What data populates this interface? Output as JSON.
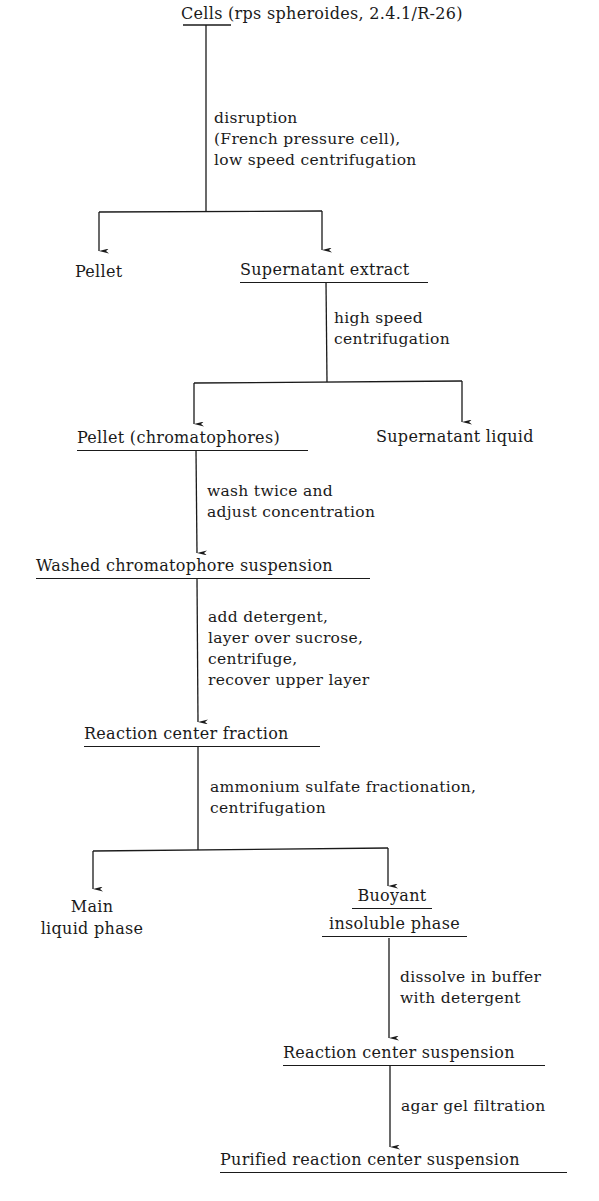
{
  "diagram": {
    "type": "flowchart",
    "nodes": {
      "cells": "Cells (rps spheroides, 2.4.1/R-26)",
      "pellet1": "Pellet",
      "supernatant_extract": "Supernatant extract",
      "pellet_chromatophores": "Pellet (chromatophores)",
      "supernatant_liquid": "Supernatant liquid",
      "washed_suspension": "Washed chromatophore suspension",
      "rc_fraction": "Reaction center fraction",
      "main_liquid_1": "Main",
      "main_liquid_2": "liquid phase",
      "buoyant_1": "Buoyant",
      "buoyant_2": "insoluble phase",
      "rc_suspension": "Reaction center suspension",
      "purified": "Purified reaction center suspension"
    },
    "steps": {
      "s1": [
        "disruption",
        "(French pressure cell),",
        "low speed centrifugation"
      ],
      "s2": [
        "high speed",
        "centrifugation"
      ],
      "s3": [
        "wash twice and",
        "adjust concentration"
      ],
      "s4": [
        "add detergent,",
        "layer over sucrose,",
        "centrifuge,",
        "recover upper layer"
      ],
      "s5": [
        "ammonium sulfate fractionation,",
        "centrifugation"
      ],
      "s6": [
        "dissolve in buffer",
        "with detergent"
      ],
      "s7": [
        "agar gel filtration"
      ]
    },
    "edges": [
      {
        "from": "cells",
        "to": "pellet1",
        "step": "s1"
      },
      {
        "from": "cells",
        "to": "supernatant_extract",
        "step": "s1"
      },
      {
        "from": "supernatant_extract",
        "to": "pellet_chromatophores",
        "step": "s2"
      },
      {
        "from": "supernatant_extract",
        "to": "supernatant_liquid",
        "step": "s2"
      },
      {
        "from": "pellet_chromatophores",
        "to": "washed_suspension",
        "step": "s3"
      },
      {
        "from": "washed_suspension",
        "to": "rc_fraction",
        "step": "s4"
      },
      {
        "from": "rc_fraction",
        "to": "main_liquid",
        "step": "s5"
      },
      {
        "from": "rc_fraction",
        "to": "buoyant_insoluble",
        "step": "s5"
      },
      {
        "from": "buoyant_insoluble",
        "to": "rc_suspension",
        "step": "s6"
      },
      {
        "from": "rc_suspension",
        "to": "purified",
        "step": "s7"
      }
    ],
    "colors": {
      "ink": "#1a1a1a",
      "background": "#ffffff"
    }
  }
}
